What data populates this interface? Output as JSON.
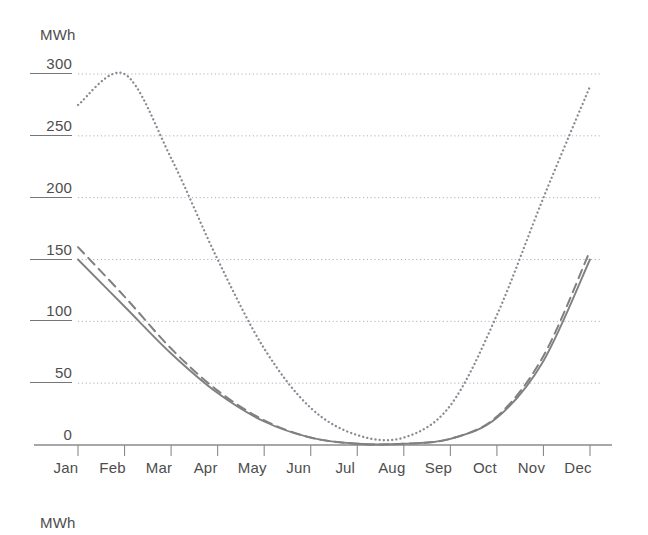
{
  "axis_unit_top": "MWh",
  "axis_unit_bottom": "MWh",
  "colors": {
    "line": "#808080",
    "gridline": "#b0b0c0",
    "axis": "#8a8a8a",
    "text": "#4d4d4d"
  },
  "yticks": [
    {
      "label": "300",
      "value": 300,
      "underlined": true
    },
    {
      "label": "250",
      "value": 250,
      "underlined": true
    },
    {
      "label": "200",
      "value": 200,
      "underlined": true
    },
    {
      "label": "150",
      "value": 150,
      "underlined": true
    },
    {
      "label": "100",
      "value": 100,
      "underlined": true
    },
    {
      "label": "50",
      "value": 50,
      "underlined": true
    },
    {
      "label": "0",
      "value": 0,
      "underlined": false
    }
  ],
  "chart_data": {
    "type": "line",
    "title": "",
    "xlabel": "",
    "ylabel": "MWh",
    "ylim": [
      0,
      300
    ],
    "grid": true,
    "legend": "none",
    "categories": [
      "Jan",
      "Feb",
      "Mar",
      "Apr",
      "May",
      "Jun",
      "Jul",
      "Aug",
      "Sep",
      "Oct",
      "Nov",
      "Dec"
    ],
    "ytick_values": [
      0,
      50,
      100,
      150,
      200,
      250,
      300
    ],
    "series": [
      {
        "name": "dotted",
        "style": "dotted",
        "color": "#8a8a95",
        "values": [
          275,
          300,
          232,
          150,
          78,
          30,
          8,
          6,
          32,
          105,
          200,
          290
        ]
      },
      {
        "name": "solid",
        "style": "solid",
        "color": "#808080",
        "values": [
          150,
          112,
          74,
          42,
          19,
          6,
          1,
          1,
          5,
          22,
          68,
          150
        ]
      },
      {
        "name": "dashed",
        "style": "dashed",
        "color": "#808080",
        "values": [
          160,
          120,
          78,
          44,
          20,
          6,
          1,
          1,
          5,
          23,
          72,
          157
        ]
      }
    ]
  }
}
